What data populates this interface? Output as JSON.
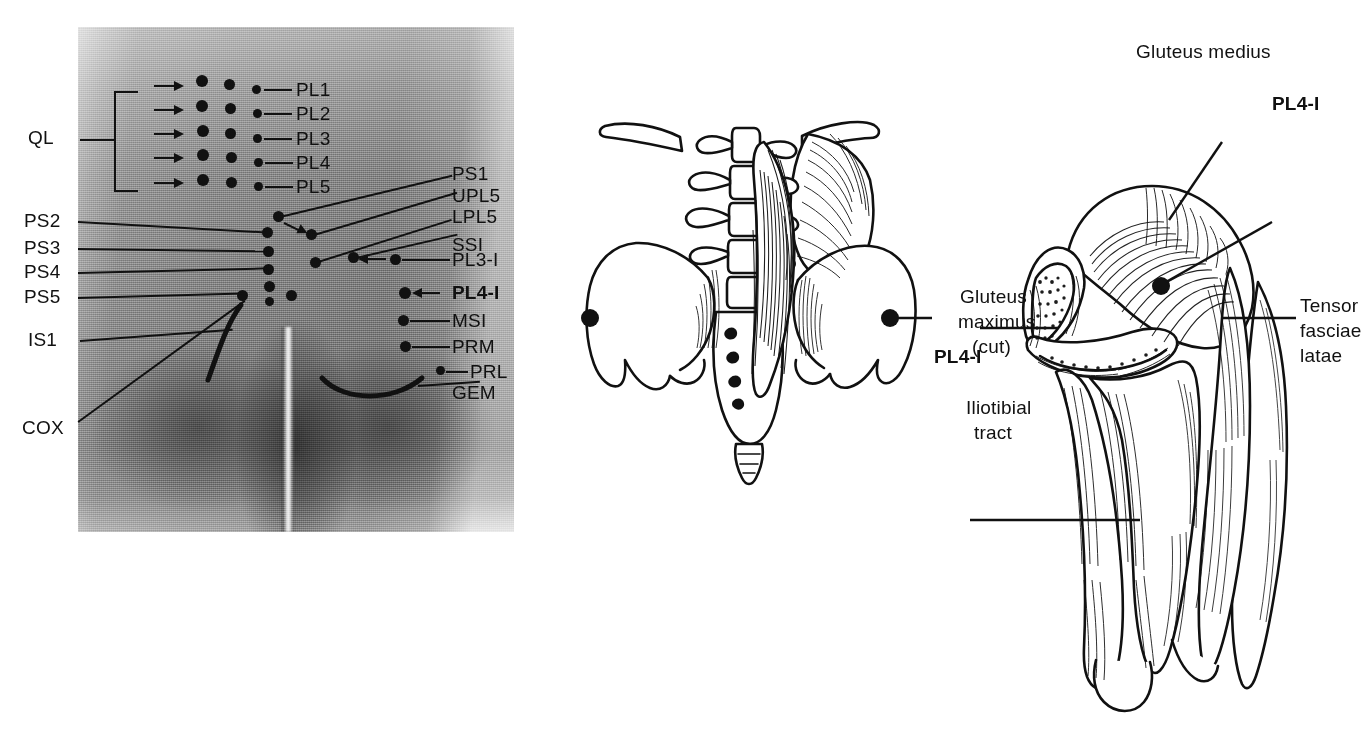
{
  "figure": {
    "type": "anatomical-illustration",
    "panel_count": 3
  },
  "photo_panel": {
    "name": "posterior-lumbopelvic-photograph",
    "bracket_label": "QL",
    "column_right_labels": [
      "PL1",
      "PL2",
      "PL3",
      "PL4",
      "PL5"
    ],
    "left_labels": [
      "PS2",
      "PS3",
      "PS4",
      "PS5",
      "IS1",
      "COX"
    ],
    "right_labels": [
      "PS1",
      "UPL5",
      "LPL5",
      "SSI",
      "PL3-I",
      "PL4-I",
      "MSI",
      "PRM",
      "PRL",
      "GEM"
    ],
    "bold_labels": [
      "PL4-I"
    ],
    "arrow_rows": 5,
    "dot_columns": 3
  },
  "pelvis_panel": {
    "name": "lumbar-spine-and-pelvis-drawing",
    "label": "PL4-I",
    "marker_count": 2
  },
  "thigh_panel": {
    "name": "gluteal-and-thigh-muscles-drawing",
    "labels": {
      "gluteus_medius": "Gluteus medius",
      "pl4i": "PL4-I",
      "tensor_fasciae_latae_l1": "Tensor",
      "tensor_fasciae_latae_l2": "fasciae",
      "tensor_fasciae_latae_l3": "latae",
      "gluteus_maximus_l1": "Gluteus",
      "gluteus_maximus_l2": "maximus",
      "gluteus_maximus_l3": "(cut)",
      "iliotibial_l1": "Iliotibial",
      "iliotibial_l2": "tract"
    }
  },
  "colors": {
    "ink": "#111111",
    "paper": "#ffffff"
  }
}
